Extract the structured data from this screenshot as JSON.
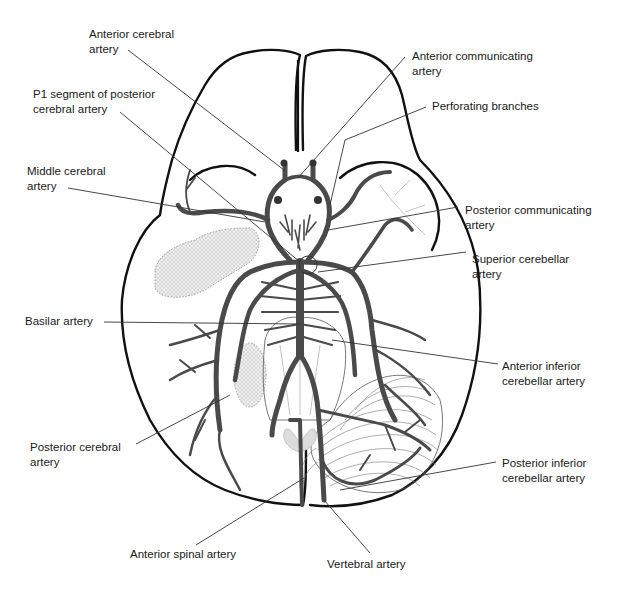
{
  "diagram": {
    "colors": {
      "outline": "#111111",
      "artery": "#4a4a4a",
      "leader": "#333333",
      "text": "#1a1a1a",
      "background": "#ffffff"
    },
    "labels": [
      {
        "id": "anterior-cerebral-artery",
        "text": "Anterior cerebral\nartery",
        "x": 89,
        "y": 27
      },
      {
        "id": "anterior-communicating-artery",
        "text": "Anterior communicating\nartery",
        "x": 412,
        "y": 49
      },
      {
        "id": "p1-segment",
        "text": "P1 segment of posterior\ncerebral artery",
        "x": 33,
        "y": 87
      },
      {
        "id": "perforating-branches",
        "text": "Perforating branches",
        "x": 432,
        "y": 99
      },
      {
        "id": "middle-cerebral-artery",
        "text": "Middle cerebral\nartery",
        "x": 27,
        "y": 164
      },
      {
        "id": "posterior-communicating-artery",
        "text": "Posterior communicating\nartery",
        "x": 465,
        "y": 203
      },
      {
        "id": "superior-cerebellar-artery",
        "text": "Superior cerebellar\nartery",
        "x": 472,
        "y": 252
      },
      {
        "id": "basilar-artery",
        "text": "Basilar artery",
        "x": 25,
        "y": 314
      },
      {
        "id": "anterior-inferior-cerebellar-artery",
        "text": "Anterior inferior\ncerebellar artery",
        "x": 502,
        "y": 359
      },
      {
        "id": "posterior-cerebral-artery",
        "text": "Posterior cerebral\nartery",
        "x": 30,
        "y": 440
      },
      {
        "id": "posterior-inferior-cerebellar-artery",
        "text": "Posterior inferior\ncerebellar artery",
        "x": 502,
        "y": 456
      },
      {
        "id": "anterior-spinal-artery",
        "text": "Anterior spinal artery",
        "x": 130,
        "y": 547
      },
      {
        "id": "vertebral-artery",
        "text": "Vertebral artery",
        "x": 327,
        "y": 557
      }
    ]
  }
}
